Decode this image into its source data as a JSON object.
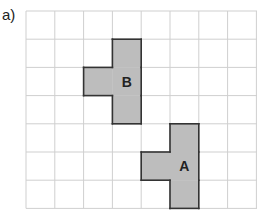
{
  "part_label": "a)",
  "grid": {
    "origin_x": 26,
    "origin_y": 11,
    "cell_w": 28.8,
    "cell_h": 28.2,
    "cols": 8,
    "rows": 7,
    "line_color": "#cfcfcf"
  },
  "shapes": [
    {
      "label": "B",
      "fill": "#bdbdbd",
      "stroke": "#333333",
      "cells": [
        [
          3,
          1
        ],
        [
          3,
          2
        ],
        [
          3,
          3
        ],
        [
          2,
          2
        ]
      ],
      "label_cell": [
        3,
        2
      ]
    },
    {
      "label": "A",
      "fill": "#bdbdbd",
      "stroke": "#333333",
      "cells": [
        [
          5,
          4
        ],
        [
          5,
          5
        ],
        [
          5,
          6
        ],
        [
          4,
          5
        ]
      ],
      "label_cell": [
        5,
        5
      ]
    }
  ]
}
